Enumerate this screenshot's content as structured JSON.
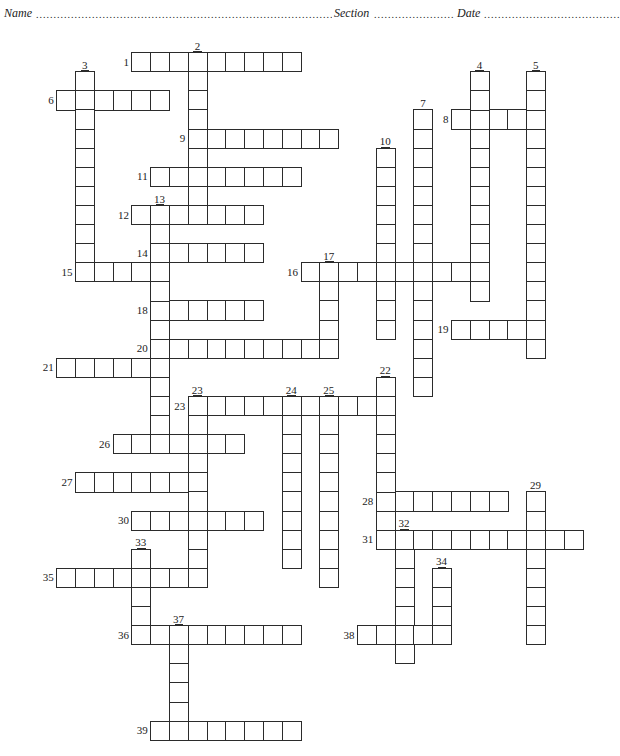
{
  "header": {
    "name_label": "Name",
    "section_label": "Section",
    "date_label": "Date",
    "dots": "........................................................................................................................"
  },
  "grid": {
    "origin_x": 56.7,
    "origin_y": 52.7,
    "cell_w": 18.8,
    "cell_h": 19.1,
    "line_color": "#2b2b2b"
  },
  "clues": {
    "across": [
      {
        "num": "1",
        "row": 0,
        "col": 4,
        "len": 9
      },
      {
        "num": "6",
        "row": 2,
        "col": 0,
        "len": 6
      },
      {
        "num": "8",
        "row": 3,
        "col": 21,
        "len": 5
      },
      {
        "num": "9",
        "row": 4,
        "col": 7,
        "len": 8
      },
      {
        "num": "11",
        "row": 6,
        "col": 5,
        "len": 8
      },
      {
        "num": "12",
        "row": 8,
        "col": 4,
        "len": 7
      },
      {
        "num": "14",
        "row": 10,
        "col": 5,
        "len": 6
      },
      {
        "num": "15",
        "row": 11,
        "col": 1,
        "len": 5
      },
      {
        "num": "16",
        "row": 11,
        "col": 13,
        "len": 10
      },
      {
        "num": "18",
        "row": 13,
        "col": 5,
        "len": 6
      },
      {
        "num": "19",
        "row": 14,
        "col": 21,
        "len": 5
      },
      {
        "num": "20",
        "row": 15,
        "col": 5,
        "len": 10
      },
      {
        "num": "21",
        "row": 16,
        "col": 0,
        "len": 6
      },
      {
        "num": "23",
        "row": 18,
        "col": 7,
        "len": 11
      },
      {
        "num": "26",
        "row": 20,
        "col": 3,
        "len": 7
      },
      {
        "num": "27",
        "row": 22,
        "col": 1,
        "len": 7
      },
      {
        "num": "28",
        "row": 23,
        "col": 17,
        "len": 7
      },
      {
        "num": "30",
        "row": 24,
        "col": 4,
        "len": 7
      },
      {
        "num": "31",
        "row": 25,
        "col": 17,
        "len": 11
      },
      {
        "num": "35",
        "row": 27,
        "col": 0,
        "len": 8
      },
      {
        "num": "36",
        "row": 30,
        "col": 4,
        "len": 9
      },
      {
        "num": "38",
        "row": 30,
        "col": 16,
        "len": 5
      },
      {
        "num": "39",
        "row": 35,
        "col": 5,
        "len": 8
      }
    ],
    "down": [
      {
        "num": "2",
        "row": 0,
        "col": 7,
        "len": 9
      },
      {
        "num": "3",
        "row": 1,
        "col": 1,
        "len": 11
      },
      {
        "num": "4",
        "row": 1,
        "col": 22,
        "len": 12
      },
      {
        "num": "5",
        "row": 1,
        "col": 25,
        "len": 15
      },
      {
        "num": "7",
        "row": 3,
        "col": 19,
        "len": 15
      },
      {
        "num": "10",
        "row": 5,
        "col": 17,
        "len": 10
      },
      {
        "num": "13",
        "row": 8,
        "col": 5,
        "len": 13
      },
      {
        "num": "17",
        "row": 11,
        "col": 14,
        "len": 5
      },
      {
        "num": "22",
        "row": 17,
        "col": 17,
        "len": 9
      },
      {
        "num": "23",
        "row": 18,
        "col": 7,
        "len": 10
      },
      {
        "num": "24",
        "row": 18,
        "col": 12,
        "len": 9
      },
      {
        "num": "25",
        "row": 18,
        "col": 14,
        "len": 10
      },
      {
        "num": "29",
        "row": 23,
        "col": 25,
        "len": 8
      },
      {
        "num": "32",
        "row": 25,
        "col": 18,
        "len": 7
      },
      {
        "num": "33",
        "row": 26,
        "col": 4,
        "len": 5
      },
      {
        "num": "34",
        "row": 27,
        "col": 20,
        "len": 4
      },
      {
        "num": "37",
        "row": 30,
        "col": 6,
        "len": 6
      }
    ]
  }
}
